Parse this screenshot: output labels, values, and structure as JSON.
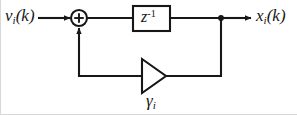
{
  "diagram": {
    "type": "signal-flow-block-diagram",
    "canvas": {
      "width": 297,
      "height": 115,
      "background": "#ffffff"
    },
    "stroke_color": "#171717",
    "text_color": "#171717",
    "labels": {
      "input": {
        "base": "v",
        "subscript": "i",
        "argument": "(k)",
        "full": "v_i(k)"
      },
      "output": {
        "base": "x",
        "subscript": "i",
        "argument": "(k)",
        "full": "x_i(k)"
      },
      "delay_block": {
        "base": "z",
        "superscript": "-1",
        "full": "z^-1"
      },
      "gain": {
        "base": "γ",
        "subscript": "i",
        "full": "γ_i"
      }
    },
    "nodes": [
      {
        "name": "summing-junction",
        "shape": "circle",
        "operator": "+",
        "cx": 79,
        "cy": 18,
        "r": 8
      },
      {
        "name": "delay-block",
        "shape": "rect",
        "x": 133,
        "y": 6,
        "width": 37,
        "height": 25
      },
      {
        "name": "gain-triangle",
        "shape": "triangle",
        "direction": "left",
        "apex_x": 142,
        "base_x": 166,
        "top_y": 59,
        "bottom_y": 93
      },
      {
        "name": "branch-junction",
        "shape": "dot",
        "cx": 221,
        "cy": 18,
        "r": 2.6
      }
    ],
    "signal_lines": [
      {
        "name": "input-line",
        "from": [
          38,
          18
        ],
        "to": [
          71,
          18
        ],
        "arrow": true
      },
      {
        "name": "sum-to-delay-line",
        "from": [
          87,
          18
        ],
        "to": [
          133,
          18
        ],
        "arrow": false
      },
      {
        "name": "delay-to-branch-line",
        "from": [
          170,
          18
        ],
        "to": [
          221,
          18
        ],
        "arrow": false
      },
      {
        "name": "branch-to-output-line",
        "from": [
          221,
          18
        ],
        "to": [
          252,
          18
        ],
        "arrow": true
      },
      {
        "name": "branch-drop-line",
        "from": [
          221,
          18
        ],
        "to": [
          221,
          76
        ],
        "arrow": false
      },
      {
        "name": "feedback-return-line",
        "from": [
          221,
          76
        ],
        "to": [
          166,
          76
        ],
        "arrow": false
      },
      {
        "name": "gain-output-line",
        "from": [
          142,
          76
        ],
        "to": [
          79,
          76
        ],
        "arrow": false
      },
      {
        "name": "feedback-riser-line",
        "from": [
          79,
          76
        ],
        "to": [
          79,
          27
        ],
        "arrow": true
      }
    ]
  }
}
